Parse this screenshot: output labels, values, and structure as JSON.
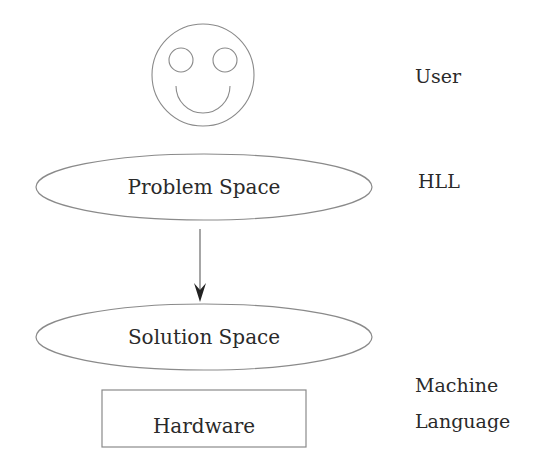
{
  "diagram": {
    "user_icon": "smiley-face-icon",
    "nodes": {
      "problem_space": "Problem Space",
      "solution_space": "Solution Space",
      "hardware": "Hardware"
    },
    "labels": {
      "user": "User",
      "hll": "HLL",
      "machine_language_line1": "Machine",
      "machine_language_line2": "Language"
    },
    "edges": [
      {
        "from": "Problem Space",
        "to": "Solution Space",
        "type": "arrow"
      }
    ],
    "colors": {
      "stroke": "#8a8a8a",
      "text": "#2a2a2a",
      "background": "#ffffff"
    }
  }
}
